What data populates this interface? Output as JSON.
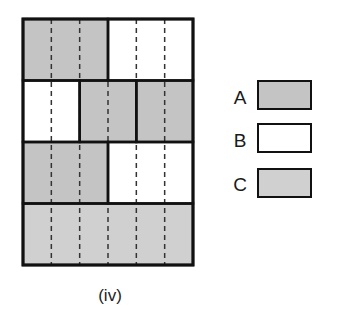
{
  "figure": {
    "caption": "(iv)",
    "colors": {
      "A": "#c4c4c4",
      "B": "#ffffff",
      "C": "#d0d0d0",
      "border": "#111111",
      "dash": "#333333"
    },
    "grid": {
      "columns": 6,
      "rows": 4,
      "rows_layout": [
        {
          "row": 1,
          "blocks": [
            {
              "span": 3,
              "type": "A"
            },
            {
              "span": 3,
              "type": "B"
            }
          ]
        },
        {
          "row": 2,
          "blocks": [
            {
              "span": 2,
              "type": "B"
            },
            {
              "span": 2,
              "type": "A"
            },
            {
              "span": 2,
              "type": "A"
            }
          ]
        },
        {
          "row": 3,
          "blocks": [
            {
              "span": 3,
              "type": "A"
            },
            {
              "span": 3,
              "type": "B"
            }
          ]
        },
        {
          "row": 4,
          "blocks": [
            {
              "span": 6,
              "type": "C"
            }
          ]
        }
      ]
    },
    "legend": [
      {
        "label": "A",
        "type": "A"
      },
      {
        "label": "B",
        "type": "B"
      },
      {
        "label": "C",
        "type": "C"
      }
    ]
  }
}
